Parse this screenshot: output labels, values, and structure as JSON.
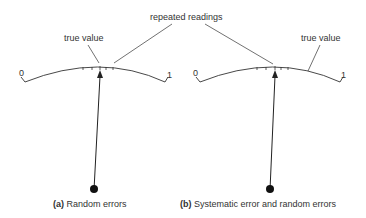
{
  "annotations": {
    "repeated_readings": "repeated readings",
    "true_value_a": "true value",
    "true_value_b": "true value"
  },
  "scale": {
    "min_label": "0",
    "max_label": "1"
  },
  "panels": [
    {
      "tag": "(a)",
      "caption": "Random errors"
    },
    {
      "tag": "(b)",
      "caption": "Systematic error and random errors"
    }
  ]
}
